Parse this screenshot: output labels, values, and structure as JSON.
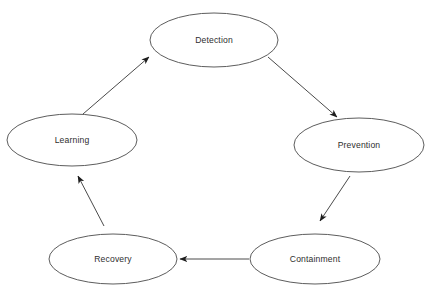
{
  "diagram": {
    "type": "cycle-flow-diagram",
    "background_color": "#ffffff",
    "node_fill_color": "#ffffff",
    "node_stroke_color": "#5d5d5d",
    "label_color": "#2e2e2e",
    "edge_color": "#4a4a4a",
    "arrowhead_color": "#1d1d1d",
    "nodes": [
      {
        "id": "detection",
        "label": "Detection",
        "shape": "ellipse",
        "cx": 214,
        "cy": 40,
        "rx": 64,
        "ry": 27
      },
      {
        "id": "prevention",
        "label": "Prevention",
        "shape": "ellipse",
        "cx": 359,
        "cy": 145,
        "rx": 65,
        "ry": 27
      },
      {
        "id": "containment",
        "label": "Containment",
        "shape": "ellipse",
        "cx": 315,
        "cy": 259,
        "rx": 65,
        "ry": 25
      },
      {
        "id": "recovery",
        "label": "Recovery",
        "shape": "ellipse",
        "cx": 113,
        "cy": 259,
        "rx": 64,
        "ry": 25
      },
      {
        "id": "learning",
        "label": "Learning",
        "shape": "ellipse",
        "cx": 72,
        "cy": 140,
        "rx": 65,
        "ry": 26
      }
    ],
    "edges": [
      {
        "id": "detection-to-prevention",
        "from": "detection",
        "to": "prevention",
        "direction": "forward",
        "x1": 268,
        "y1": 57,
        "x2": 337,
        "y2": 117
      },
      {
        "id": "prevention-to-containment",
        "from": "prevention",
        "to": "containment",
        "direction": "forward",
        "x1": 350,
        "y1": 176,
        "x2": 320,
        "y2": 221
      },
      {
        "id": "containment-to-recovery",
        "from": "containment",
        "to": "recovery",
        "direction": "forward",
        "x1": 249,
        "y1": 259,
        "x2": 180,
        "y2": 259
      },
      {
        "id": "recovery-to-learning",
        "from": "recovery",
        "to": "learning",
        "direction": "forward",
        "x1": 104,
        "y1": 226,
        "x2": 78,
        "y2": 176
      },
      {
        "id": "learning-to-detection",
        "from": "learning",
        "to": "detection",
        "direction": "forward",
        "x1": 83,
        "y1": 114,
        "x2": 149,
        "y2": 57
      }
    ]
  }
}
